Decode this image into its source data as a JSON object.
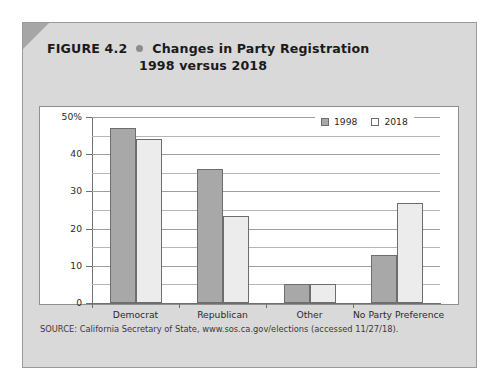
{
  "figure": {
    "number": "FIGURE 4.2",
    "bullet_icon": "bullet-dot-icon",
    "title_line_1": "Changes in Party Registration",
    "title_line_2": "1998 versus 2018",
    "source": "SOURCE: California Secretary of State, www.sos.ca.gov/elections (accessed 11/27/18)."
  },
  "colors": {
    "card_background": "#d9d9d9",
    "corner_fold": "#a6a6a6",
    "panel_background": "#ffffff",
    "series_1998": "#a8a8a8",
    "series_2018": "#ececec",
    "bar_outline": "#6d6d6d",
    "gridline": "#b5b5b5",
    "axis": "#6f6f6f",
    "text": "#1b1b1b"
  },
  "chart_data": {
    "type": "bar",
    "title": "Changes in Party Registration 1998 versus 2018",
    "xlabel": "",
    "ylabel": "",
    "categories": [
      "Democrat",
      "Republican",
      "Other",
      "No Party Preference"
    ],
    "series": [
      {
        "name": "1998",
        "values": [
          47,
          36,
          5,
          13
        ]
      },
      {
        "name": "2018",
        "values": [
          44,
          23.5,
          5,
          27
        ]
      }
    ],
    "ylim": [
      0,
      50
    ],
    "yticks": [
      0,
      10,
      20,
      30,
      40,
      50
    ],
    "ytick_labels": [
      "0",
      "10",
      "20",
      "30",
      "40",
      "50%"
    ],
    "minor_gridlines": [
      5,
      15,
      25,
      35,
      45
    ],
    "grid": true,
    "legend": [
      "1998",
      "2018"
    ],
    "legend_position": "top-right"
  }
}
